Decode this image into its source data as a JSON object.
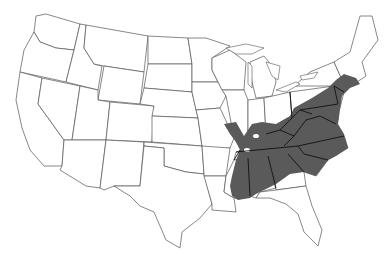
{
  "map": {
    "type": "distribution-range-map",
    "region": "Contiguous United States",
    "colors": {
      "background": "#ffffff",
      "state_fill": "#ffffff",
      "state_border": "#555555",
      "range_fill": "#5a5a5a",
      "range_state_border": "#111111"
    },
    "shaded_states": [
      "Illinois (south)",
      "Indiana (south)",
      "Ohio (south)",
      "Pennsylvania",
      "New York (southeast)",
      "New Jersey",
      "Connecticut",
      "Rhode Island",
      "Massachusetts",
      "Delaware",
      "Maryland",
      "West Virginia",
      "Virginia",
      "Kentucky",
      "Tennessee",
      "North Carolina",
      "South Carolina",
      "Mississippi",
      "Alabama",
      "Georgia (north)",
      "Missouri (east edge)",
      "Arkansas (east edge)",
      "Louisiana (east)"
    ]
  }
}
